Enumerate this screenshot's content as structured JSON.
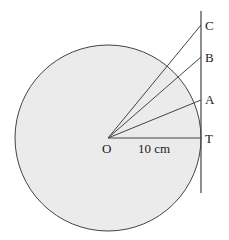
{
  "diagram": {
    "type": "geometry",
    "circle": {
      "center_label": "O",
      "fill": "#ebebeb",
      "stroke": "#444444"
    },
    "tangent_point_label": "T",
    "points": [
      "A",
      "B",
      "C"
    ],
    "radius_label": "10 cm"
  }
}
